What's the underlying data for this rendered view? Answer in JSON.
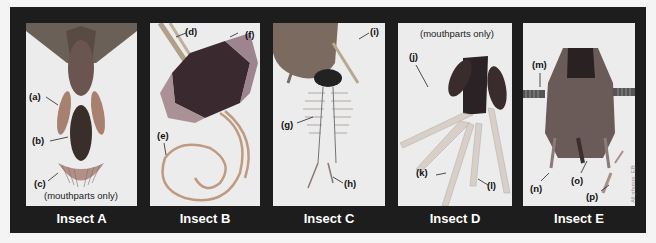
{
  "figure": {
    "panels": [
      {
        "id": "A",
        "caption": "Insect A",
        "note": "(mouthparts only)",
        "labels": [
          "(a)",
          "(b)",
          "(c)"
        ]
      },
      {
        "id": "B",
        "caption": "Insect B",
        "labels": [
          "(d)",
          "(e)",
          "(f)"
        ]
      },
      {
        "id": "C",
        "caption": "Insect C",
        "labels": [
          "(g)",
          "(h)",
          "(i)"
        ]
      },
      {
        "id": "D",
        "caption": "Insect D",
        "note": "(mouthparts only)",
        "labels": [
          "(j)",
          "(k)",
          "(l)"
        ]
      },
      {
        "id": "E",
        "caption": "Insect E",
        "labels": [
          "(m)",
          "(n)",
          "(o)",
          "(p)"
        ]
      }
    ],
    "credit": "All photos: EB",
    "colors": {
      "frame": "#1d1d1d",
      "panel_bg": "#ececec",
      "caption_text": "#ffffff",
      "page_bg": "#f4f4f4"
    }
  }
}
